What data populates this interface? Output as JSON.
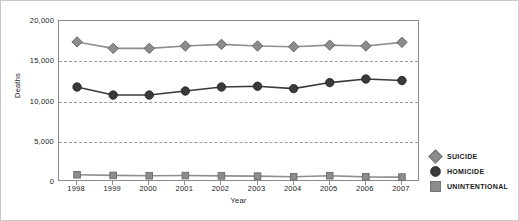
{
  "chart_data": {
    "type": "line",
    "title": "",
    "xlabel": "Year",
    "ylabel": "Deaths",
    "categories": [
      "1998",
      "1999",
      "2000",
      "2001",
      "2002",
      "2003",
      "2004",
      "2005",
      "2006",
      "2007"
    ],
    "ylim": [
      0,
      20000
    ],
    "yticks": [
      0,
      5000,
      10000,
      15000,
      20000
    ],
    "ytick_labels": [
      "0",
      "5,000",
      "10,000",
      "15,000",
      "20,000"
    ],
    "grid": true,
    "legend_position": "right",
    "series": [
      {
        "name": "SUICIDE",
        "marker": "diamond",
        "color": "#8c8c8c",
        "line_color": "#8f8f8f",
        "values": [
          17400,
          16600,
          16600,
          16900,
          17100,
          16900,
          16800,
          17000,
          16900,
          17350
        ]
      },
      {
        "name": "HOMICIDE",
        "marker": "circle",
        "color": "#3a3a3a",
        "line_color": "#3a3a3a",
        "values": [
          11800,
          10800,
          10800,
          11300,
          11800,
          11900,
          11600,
          12350,
          12800,
          12600
        ]
      },
      {
        "name": "UNINTENTIONAL",
        "marker": "square",
        "color": "#8c8c8c",
        "line_color": "#8f8f8f",
        "values": [
          900,
          820,
          780,
          800,
          760,
          730,
          650,
          780,
          640,
          610
        ]
      }
    ]
  },
  "legend": {
    "items": [
      {
        "label": "SUICIDE",
        "marker": "diamond-marker"
      },
      {
        "label": "HOMICIDE",
        "marker": "circle-marker"
      },
      {
        "label": "UNINTENTIONAL",
        "marker": "square-marker"
      }
    ]
  }
}
